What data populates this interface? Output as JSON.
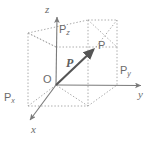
{
  "figure": {
    "name": "3d-cartesian-vector-diagram",
    "width": 151,
    "height": 141,
    "background_color": "#ffffff",
    "line_color": "#7a7a7a",
    "dotted_color": "#a8a8a8",
    "vector_color": "#555555",
    "text_color": "#6b6b6b"
  },
  "axes": {
    "x_label": "x",
    "y_label": "y",
    "z_label": "z",
    "origin_label": "O"
  },
  "points": {
    "p_label": "P",
    "px_label": "P",
    "px_sub": "x",
    "py_label": "P",
    "py_sub": "y",
    "pz_label": "P",
    "pz_sub": "z"
  },
  "vector": {
    "label": "P"
  },
  "geometry": {
    "origin": [
      56,
      85
    ],
    "z_axis_tip": [
      57,
      15
    ],
    "y_axis_tip": [
      144,
      86
    ],
    "x_axis_tip": [
      28,
      122
    ],
    "vector_tip": [
      96,
      47
    ],
    "box_bottom_front_left": [
      56,
      85
    ],
    "box_bottom_front_right": [
      117,
      85
    ],
    "box_bottom_back_right": [
      88,
      106
    ],
    "box_bottom_back_left": [
      28,
      106
    ],
    "box_top_front_left": [
      56,
      47
    ],
    "box_top_front_right": [
      117,
      47
    ],
    "box_top_back_right": [
      88,
      20
    ],
    "box_top_back_left": [
      28,
      33
    ]
  }
}
